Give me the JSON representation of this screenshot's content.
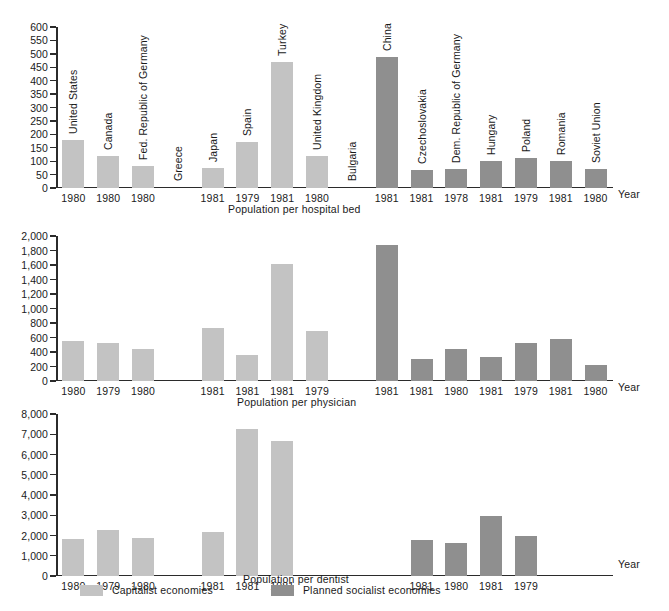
{
  "categories": [
    {
      "name": "United States",
      "group": "capitalist"
    },
    {
      "name": "Canada",
      "group": "capitalist"
    },
    {
      "name": "Fed. Republic of Germany",
      "group": "capitalist"
    },
    {
      "name": "Greece",
      "group": "capitalist"
    },
    {
      "name": "Japan",
      "group": "capitalist"
    },
    {
      "name": "Spain",
      "group": "capitalist"
    },
    {
      "name": "Turkey",
      "group": "capitalist"
    },
    {
      "name": "United Kingdom",
      "group": "capitalist"
    },
    {
      "name": "Bulgaria",
      "group": "socialist"
    },
    {
      "name": "China",
      "group": "socialist"
    },
    {
      "name": "Czechoslovakia",
      "group": "socialist"
    },
    {
      "name": "Dem. Republic of Germany",
      "group": "socialist"
    },
    {
      "name": "Hungary",
      "group": "socialist"
    },
    {
      "name": "Poland",
      "group": "socialist"
    },
    {
      "name": "Romania",
      "group": "socialist"
    },
    {
      "name": "Soviet Union",
      "group": "socialist"
    }
  ],
  "legend": {
    "capitalist_label": "Capitalist economies",
    "socialist_label": "Planned socialist economies",
    "capitalist_color": "#c3c3c3",
    "socialist_color": "#8f8f8f"
  },
  "axis_word": "Year",
  "chart_data": [
    {
      "type": "bar",
      "title": "Population per hospital bed",
      "xlabel": "Year",
      "ylabel": "",
      "ylim": [
        0,
        600
      ],
      "yticks": [
        0,
        50,
        100,
        150,
        200,
        250,
        300,
        350,
        400,
        450,
        500,
        550,
        600
      ],
      "ytick_labels": [
        "0",
        "50",
        "100",
        "150",
        "200",
        "250",
        "300",
        "350",
        "400",
        "450",
        "500",
        "550",
        "600"
      ],
      "grid": false,
      "legend_position": "bottom",
      "categories": [
        "United States",
        "Canada",
        "Fed. Republic of Germany",
        "Greece",
        "Japan",
        "Spain",
        "Turkey",
        "United Kingdom",
        "Bulgaria",
        "China",
        "Czechoslovakia",
        "Dem. Republic of Germany",
        "Hungary",
        "Poland",
        "Romania",
        "Soviet Union"
      ],
      "tick_labels": [
        "1980",
        "1980",
        "1980",
        "",
        "1981",
        "1979",
        "1981",
        "1980",
        "",
        "1981",
        "1981",
        "1978",
        "1981",
        "1979",
        "1981",
        "1980"
      ],
      "values": [
        180,
        120,
        82,
        null,
        75,
        172,
        470,
        118,
        null,
        490,
        68,
        72,
        100,
        110,
        102,
        72
      ],
      "groups": [
        "capitalist",
        "capitalist",
        "capitalist",
        "capitalist",
        "capitalist",
        "capitalist",
        "capitalist",
        "capitalist",
        "socialist",
        "socialist",
        "socialist",
        "socialist",
        "socialist",
        "socialist",
        "socialist",
        "socialist"
      ]
    },
    {
      "type": "bar",
      "title": "Population per physician",
      "xlabel": "Year",
      "ylabel": "",
      "ylim": [
        0,
        2000
      ],
      "yticks": [
        0,
        200,
        400,
        600,
        800,
        1000,
        1200,
        1400,
        1600,
        1800,
        2000
      ],
      "ytick_labels": [
        "0",
        "200",
        "400",
        "600",
        "800",
        "1,000",
        "1,200",
        "1,400",
        "1,600",
        "1,800",
        "2,000"
      ],
      "grid": false,
      "legend_position": "bottom",
      "categories": [
        "United States",
        "Canada",
        "Fed. Republic of Germany",
        "Greece",
        "Japan",
        "Spain",
        "Turkey",
        "United Kingdom",
        "Bulgaria",
        "China",
        "Czechoslovakia",
        "Dem. Republic of Germany",
        "Hungary",
        "Poland",
        "Romania",
        "Soviet Union"
      ],
      "tick_labels": [
        "1980",
        "1979",
        "1980",
        "",
        "1981",
        "1981",
        "1981",
        "1979",
        "",
        "1981",
        "1981",
        "1980",
        "1981",
        "1979",
        "1981",
        "1980"
      ],
      "values": [
        550,
        530,
        435,
        null,
        730,
        355,
        1620,
        690,
        null,
        1880,
        300,
        440,
        330,
        520,
        580,
        215
      ],
      "groups": [
        "capitalist",
        "capitalist",
        "capitalist",
        "capitalist",
        "capitalist",
        "capitalist",
        "capitalist",
        "capitalist",
        "socialist",
        "socialist",
        "socialist",
        "socialist",
        "socialist",
        "socialist",
        "socialist",
        "socialist"
      ]
    },
    {
      "type": "bar",
      "title": "Population per dentist",
      "xlabel": "Year",
      "ylabel": "",
      "ylim": [
        0,
        8000
      ],
      "yticks": [
        0,
        1000,
        2000,
        3000,
        4000,
        5000,
        6000,
        7000,
        8000
      ],
      "ytick_labels": [
        "0",
        "1,000",
        "2,000",
        "3,000",
        "4,000",
        "5,000",
        "6,000",
        "7,000",
        "8,000"
      ],
      "grid": false,
      "legend_position": "bottom",
      "categories": [
        "United States",
        "Canada",
        "Fed. Republic of Germany",
        "Greece",
        "Japan",
        "Spain",
        "Turkey",
        "United Kingdom",
        "Bulgaria",
        "China",
        "Czechoslovakia",
        "Dem. Republic of Germany",
        "Hungary",
        "Poland",
        "Romania",
        "Soviet Union"
      ],
      "tick_labels": [
        "1980",
        "1979",
        "1980",
        "",
        "1981",
        "1981",
        "1981",
        "",
        "",
        "",
        "1981",
        "1980",
        "1981",
        "1979",
        "",
        ""
      ],
      "values": [
        1820,
        2280,
        1880,
        null,
        2160,
        7250,
        6670,
        null,
        null,
        null,
        1800,
        1620,
        2950,
        1980,
        null,
        null
      ],
      "groups": [
        "capitalist",
        "capitalist",
        "capitalist",
        "capitalist",
        "capitalist",
        "capitalist",
        "capitalist",
        "capitalist",
        "socialist",
        "socialist",
        "socialist",
        "socialist",
        "socialist",
        "socialist",
        "socialist",
        "socialist"
      ]
    }
  ]
}
